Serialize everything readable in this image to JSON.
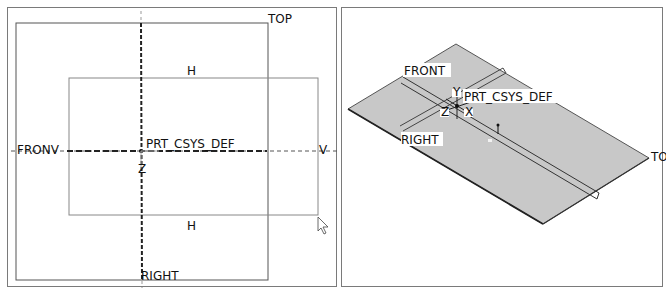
{
  "top_view": {
    "labels": {
      "top_plane": "TOP",
      "front_plane": "FRONV",
      "right_plane": "RIGHT",
      "csys": "PRT_CSYS_DEF",
      "sketch_h_top": "H",
      "sketch_h_bottom": "H",
      "sketch_v": "V",
      "axis_z": "Z"
    }
  },
  "iso_view": {
    "labels": {
      "front_plane": "FRONT",
      "right_plane": "RIGHT",
      "top_plane": "TO",
      "csys": "PRT_CSYS_DEF",
      "axis_x": "X",
      "axis_z": "Z",
      "axis_y": "Y"
    }
  },
  "colors": {
    "plane_fill": "#c8c8c8",
    "line": "#333333",
    "frame": "#7a7a7a"
  }
}
